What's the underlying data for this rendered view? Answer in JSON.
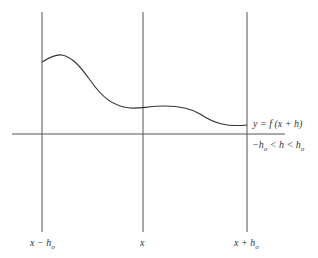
{
  "diagram": {
    "title": "",
    "curve_label": "y = f (x + h)",
    "range_label": {
      "left": "−h",
      "left_sub": "o",
      "mid": " < h < h",
      "right_sub": "o"
    },
    "ticks": [
      {
        "label": "x − h",
        "sub": "o"
      },
      {
        "label": "x",
        "sub": ""
      },
      {
        "label": "x + h",
        "sub": "o"
      }
    ],
    "colors": {
      "line": "#555555",
      "curve": "#333333",
      "text": "#333333"
    }
  }
}
